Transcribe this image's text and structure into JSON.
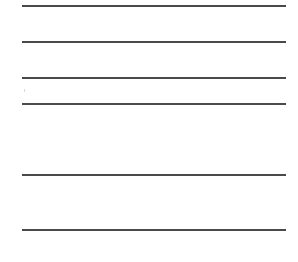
{
  "page": {
    "type": "ruled-lines",
    "line_color": "#4a4a4a",
    "background": "#ffffff",
    "lines": [
      {
        "y": 5
      },
      {
        "y": 41
      },
      {
        "y": 77
      },
      {
        "y": 103
      },
      {
        "y": 174
      },
      {
        "y": 229
      }
    ]
  }
}
